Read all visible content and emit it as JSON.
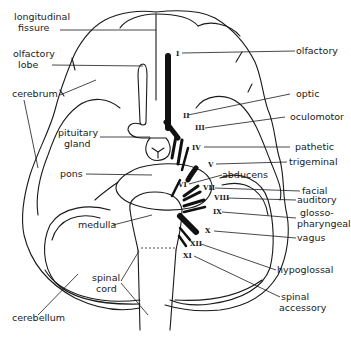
{
  "diagram": {
    "structures": [
      {
        "id": "longitudinal-fissure",
        "label_line1": "longitudinal",
        "label_line2": "fissure"
      },
      {
        "id": "olfactory-lobe",
        "label_line1": "olfactory",
        "label_line2": "lobe"
      },
      {
        "id": "cerebrum",
        "label_line1": "cerebrum"
      },
      {
        "id": "pituitary-gland",
        "label_line1": "pituitary",
        "label_line2": "gland"
      },
      {
        "id": "pons",
        "label_line1": "pons"
      },
      {
        "id": "medulla",
        "label_line1": "medulla"
      },
      {
        "id": "spinal-cord",
        "label_line1": "spinal",
        "label_line2": "cord"
      },
      {
        "id": "cerebellum",
        "label_line1": "cerebellum"
      }
    ],
    "nerves": [
      {
        "numeral": "I",
        "name": "olfactory"
      },
      {
        "numeral": "II",
        "name": "optic"
      },
      {
        "numeral": "III",
        "name": "oculomotor"
      },
      {
        "numeral": "IV",
        "name": "pathetic"
      },
      {
        "numeral": "V",
        "name": "trigeminal"
      },
      {
        "numeral": "VI",
        "name": "abducens"
      },
      {
        "numeral": "VII",
        "name": "facial"
      },
      {
        "numeral": "VIII",
        "name": "auditory"
      },
      {
        "numeral": "IX",
        "name_line1": "glosso-",
        "name_line2": "pharyngeal"
      },
      {
        "numeral": "X",
        "name": "vagus"
      },
      {
        "numeral": "XII",
        "name": "hypoglossal"
      },
      {
        "numeral": "XI",
        "name_line1": "spinal",
        "name_line2": "accessory"
      }
    ]
  }
}
